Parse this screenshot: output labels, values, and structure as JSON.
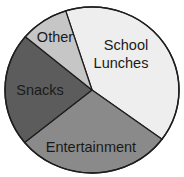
{
  "chart_data": {
    "type": "pie",
    "title": "",
    "start_angle_deg": 342.4,
    "direction": "clockwise",
    "slices": [
      {
        "label": "School Lunches",
        "value": 40,
        "color": "#eeeeee",
        "label_lines": [
          "School",
          "Lunches"
        ]
      },
      {
        "label": "Entertainment",
        "value": 29,
        "color": "#8a8a8a",
        "label_lines": [
          "Entertainment"
        ]
      },
      {
        "label": "Snacks",
        "value": 22,
        "color": "#5c5c5c",
        "label_lines": [
          "Snacks"
        ]
      },
      {
        "label": "Other",
        "value": 9,
        "color": "#c6c6c6",
        "label_lines": [
          "Other"
        ]
      }
    ],
    "categories": [
      "School Lunches",
      "Entertainment",
      "Snacks",
      "Other"
    ],
    "values": [
      40,
      29,
      22,
      9
    ],
    "units": "percent (estimated from slice angles)",
    "legend": "none (labels inside slices)"
  },
  "labels": {
    "school": "School",
    "lunches": "Lunches",
    "entertainment": "Entertainment",
    "snacks": "Snacks",
    "other": "Other"
  }
}
